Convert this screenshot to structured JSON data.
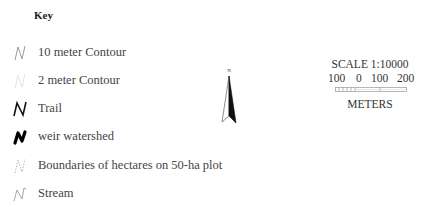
{
  "legend": {
    "title": "Key",
    "items": [
      {
        "label": "10 meter Contour",
        "symbol": "contour-10m-icon",
        "color": "#9a9a9a"
      },
      {
        "label": "2 meter Contour",
        "symbol": "contour-2m-icon",
        "color": "#e0e0e0"
      },
      {
        "label": "Trail",
        "symbol": "trail-icon",
        "color": "#111111"
      },
      {
        "label": "weir watershed",
        "symbol": "weir-watershed-icon",
        "color": "#000000"
      },
      {
        "label": "Boundaries of hectares on 50-ha plot",
        "symbol": "hectare-boundary-icon",
        "color": "#b0b0b0"
      },
      {
        "label": "Stream",
        "symbol": "stream-icon",
        "color": "#a0a0a0"
      }
    ]
  },
  "north_arrow": {
    "label": "N"
  },
  "scale": {
    "title": "SCALE 1:10000",
    "ticks": [
      "100",
      "0",
      "100",
      "200"
    ],
    "units": "METERS"
  }
}
